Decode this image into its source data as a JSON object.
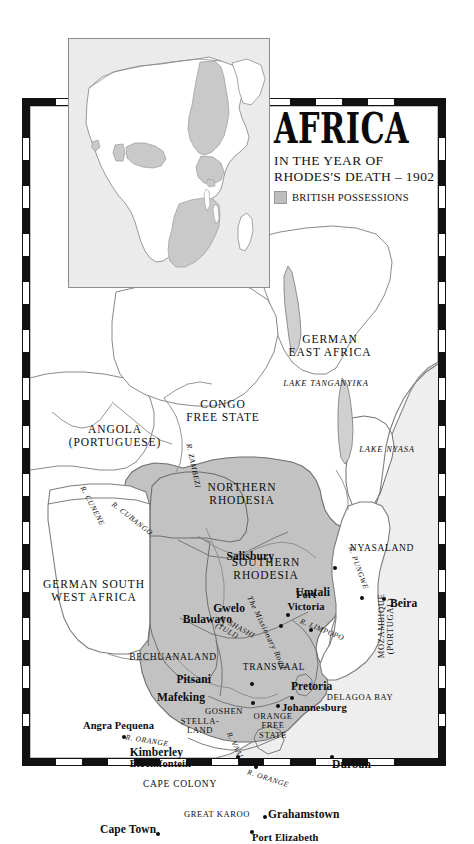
{
  "title_block": {
    "title": "AFRICA",
    "subtitle_line1": "IN THE YEAR OF",
    "subtitle_line2": "RHODES'S DEATH – 1902",
    "legend_label": "BRITISH POSSESSIONS",
    "legend_swatch_color": "#bdbdbd"
  },
  "colors": {
    "sea": "#eeeeee",
    "land_neutral": "#ffffff",
    "british_possession": "#c2c2c2",
    "coastline": "#7d7d7d",
    "frame": "#111111",
    "label_text": "#0d0d0d"
  },
  "inset": {
    "name": "africa-continent-inset",
    "highlight_color": "#c9c9c9",
    "background": "#ebebeb"
  },
  "countries": [
    {
      "name": "german-east-africa",
      "label": "GERMAN\nEAST AFRICA",
      "x": 300,
      "y": 240,
      "class": "country"
    },
    {
      "name": "congo-free-state",
      "label": "CONGO\nFREE STATE",
      "x": 193,
      "y": 305,
      "class": "country"
    },
    {
      "name": "angola-portuguese",
      "label": "ANGOLA\n(PORTUGUESE)",
      "x": 85,
      "y": 330,
      "class": "country"
    },
    {
      "name": "northern-rhodesia",
      "label": "NORTHERN\nRHODESIA",
      "x": 212,
      "y": 388,
      "class": "country"
    },
    {
      "name": "nyasaland",
      "label": "NYASALAND",
      "x": 352,
      "y": 442,
      "class": "country sm"
    },
    {
      "name": "southern-rhodesia",
      "label": "SOUTHERN\nRHODESIA",
      "x": 236,
      "y": 463,
      "class": "country"
    },
    {
      "name": "german-south-west-africa",
      "label": "GERMAN SOUTH\nWEST AFRICA",
      "x": 64,
      "y": 485,
      "class": "country"
    },
    {
      "name": "bechuanaland",
      "label": "BECHUANALAND",
      "x": 143,
      "y": 551,
      "class": "country sm"
    },
    {
      "name": "transvaal",
      "label": "TRANSVAAL",
      "x": 244,
      "y": 561,
      "class": "country sm"
    },
    {
      "name": "mozambique-portugal",
      "label": "MOZAMBIQUE\n(PORTUGAL)",
      "x": 356,
      "y": 520,
      "class": "country xs rot"
    },
    {
      "name": "delagoa-bay",
      "label": "DELAGOA BAY",
      "x": 330,
      "y": 592,
      "class": "country xs"
    },
    {
      "name": "goshen",
      "label": "GOSHEN",
      "x": 194,
      "y": 606,
      "class": "country xs"
    },
    {
      "name": "stella-land",
      "label": "STELLA-\nLAND",
      "x": 170,
      "y": 620,
      "class": "country xs"
    },
    {
      "name": "orange-free-state",
      "label": "ORANGE\nFREE\nSTATE",
      "x": 243,
      "y": 620,
      "class": "country xs"
    },
    {
      "name": "cape-colony",
      "label": "CAPE COLONY",
      "x": 150,
      "y": 678,
      "class": "country sm"
    },
    {
      "name": "great-karoo",
      "label": "GREAT KAROO",
      "x": 187,
      "y": 709,
      "class": "country xs"
    }
  ],
  "water_labels": [
    {
      "name": "lake-tanganyika",
      "label": "LAKE TANGANYIKA",
      "x": 296,
      "y": 278
    },
    {
      "name": "lake-nyasa",
      "label": "LAKE NYASA",
      "x": 357,
      "y": 344
    }
  ],
  "rivers": [
    {
      "name": "river-cunene",
      "label": "R. CUNENE",
      "x": 62,
      "y": 400,
      "rot": 62
    },
    {
      "name": "river-cubango",
      "label": "R. CUBANGO",
      "x": 102,
      "y": 413,
      "rot": 38
    },
    {
      "name": "river-zambezi",
      "label": "R. ZAMBEZI",
      "x": 163,
      "y": 360,
      "rot": 78
    },
    {
      "name": "river-shashi",
      "label": "R. SHASHI\n(TULI)",
      "x": 205,
      "y": 525,
      "rot": 28
    },
    {
      "name": "river-limpopo",
      "label": "R. LIMPOPO",
      "x": 292,
      "y": 524,
      "rot": 22
    },
    {
      "name": "river-pungwe",
      "label": "R. PUNGWE",
      "x": 328,
      "y": 462,
      "rot": 70
    },
    {
      "name": "the-missionary-road",
      "label": "The Missionary Road",
      "x": 236,
      "y": 527,
      "rot": 64
    },
    {
      "name": "river-vaal",
      "label": "R. VAAL",
      "x": 205,
      "y": 640,
      "rot": 64
    },
    {
      "name": "river-orange-west",
      "label": "R. ORANGE",
      "x": 117,
      "y": 635,
      "rot": 9
    },
    {
      "name": "river-orange-east",
      "label": "R. ORANGE",
      "x": 238,
      "y": 673,
      "rot": 18
    }
  ],
  "cities": [
    {
      "name": "salisbury",
      "label": "Salisbury",
      "lx": 244,
      "ly": 450,
      "anchor": "end",
      "dx": 305,
      "dy": 462
    },
    {
      "name": "umtali",
      "label": "Umtali",
      "lx": 300,
      "ly": 486,
      "anchor": "end",
      "dx": 332,
      "dy": 492
    },
    {
      "name": "beira",
      "label": "Beira",
      "lx": 360,
      "ly": 497,
      "anchor": "start",
      "dx": 354,
      "dy": 493
    },
    {
      "name": "gwelo",
      "label": "Gwelo",
      "lx": 215,
      "ly": 502,
      "anchor": "end",
      "dx": 258,
      "dy": 509
    },
    {
      "name": "fort-victoria",
      "label": "Fort\nVictoria",
      "lx": 276,
      "ly": 495,
      "anchor": "middle",
      "dx": 281,
      "dy": 524
    },
    {
      "name": "bulawayo",
      "label": "Bulawayo",
      "lx": 202,
      "ly": 513,
      "anchor": "end",
      "dx": 251,
      "dy": 520
    },
    {
      "name": "pitsani",
      "label": "Pitsani",
      "lx": 181,
      "ly": 573,
      "anchor": "end",
      "dx": 222,
      "dy": 578
    },
    {
      "name": "pretoria",
      "label": "Pretoria",
      "lx": 261,
      "ly": 580,
      "anchor": "start",
      "dx": 262,
      "dy": 592
    },
    {
      "name": "mafeking",
      "label": "Mafeking",
      "lx": 175,
      "ly": 591,
      "anchor": "end",
      "dx": 223,
      "dy": 597
    },
    {
      "name": "johannesburg",
      "label": "Johannesburg",
      "lx": 252,
      "ly": 602,
      "anchor": "start",
      "dx": 248,
      "dy": 600
    },
    {
      "name": "angra-pequena",
      "label": "Angra Pequena",
      "lx": 53,
      "ly": 620,
      "anchor": "start",
      "dx": 94,
      "dy": 631
    },
    {
      "name": "kimberley",
      "label": "Kimberley",
      "lx": 153,
      "ly": 646,
      "anchor": "end",
      "dx": 208,
      "dy": 651
    },
    {
      "name": "bloemfontein",
      "label": "Bloemfontein",
      "lx": 161,
      "ly": 658,
      "anchor": "end",
      "dx": 226,
      "dy": 661
    },
    {
      "name": "durban",
      "label": "Durban",
      "lx": 302,
      "ly": 658,
      "anchor": "start",
      "dx": 302,
      "dy": 651
    },
    {
      "name": "grahamstown",
      "label": "Grahamstown",
      "lx": 238,
      "ly": 708,
      "anchor": "start",
      "dx": 235,
      "dy": 711
    },
    {
      "name": "cape-town",
      "label": "Cape Town",
      "lx": 70,
      "ly": 723,
      "anchor": "start",
      "dx": 128,
      "dy": 728
    },
    {
      "name": "port-elizabeth",
      "label": "Port Elizabeth",
      "lx": 222,
      "ly": 732,
      "anchor": "start",
      "dx": 222,
      "dy": 726
    }
  ]
}
